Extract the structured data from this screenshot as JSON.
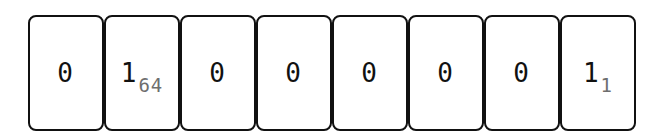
{
  "diagram": {
    "type": "bit-cell-row",
    "cells": [
      {
        "value": "0",
        "weight": ""
      },
      {
        "value": "1",
        "weight": "64"
      },
      {
        "value": "0",
        "weight": ""
      },
      {
        "value": "0",
        "weight": ""
      },
      {
        "value": "0",
        "weight": ""
      },
      {
        "value": "0",
        "weight": ""
      },
      {
        "value": "0",
        "weight": ""
      },
      {
        "value": "1",
        "weight": "1"
      }
    ],
    "colors": {
      "border": "#111111",
      "value_text": "#111111",
      "weight_text": "#6e6e6e",
      "background": "#ffffff"
    }
  }
}
